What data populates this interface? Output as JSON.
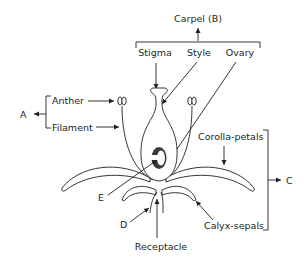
{
  "labels": {
    "carpel": "Carpel (B)",
    "stigma": "Stigma",
    "style": "Style",
    "ovary": "Ovary",
    "anther": "Anther",
    "filament": "Filament",
    "stamen_group": "A",
    "corolla": "Corolla-petals",
    "calyx": "Calyx-sepals",
    "perianth_group": "C",
    "d": "D",
    "e": "E",
    "receptacle": "Receptacle"
  },
  "colors": {
    "line": "#231f20",
    "ovule_fill": "#3a3a3a",
    "background": "#ffffff"
  }
}
